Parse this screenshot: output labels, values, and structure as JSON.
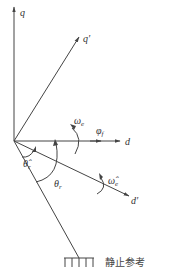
{
  "diagram": {
    "type": "coordinate-frame-vector-diagram",
    "stroke_color": "#444444",
    "axes": {
      "q": {
        "label": "q"
      },
      "q_prime": {
        "label": "q",
        "prime": "′"
      },
      "d": {
        "label": "d"
      },
      "d_prime": {
        "label": "d",
        "prime": "′"
      }
    },
    "vectors": {
      "phi_f": {
        "label": "φ",
        "subscript": "f"
      }
    },
    "rotations": {
      "omega_e": {
        "label": "ω",
        "subscript": "e"
      },
      "omega_e_hat": {
        "label": "ω̂",
        "subscript": "e"
      }
    },
    "angles": {
      "theta_r_hat": {
        "label": "θ̂",
        "subscript": "r"
      },
      "theta_r": {
        "label": "θ",
        "subscript": "r"
      }
    },
    "ground_label": "静止参考"
  }
}
